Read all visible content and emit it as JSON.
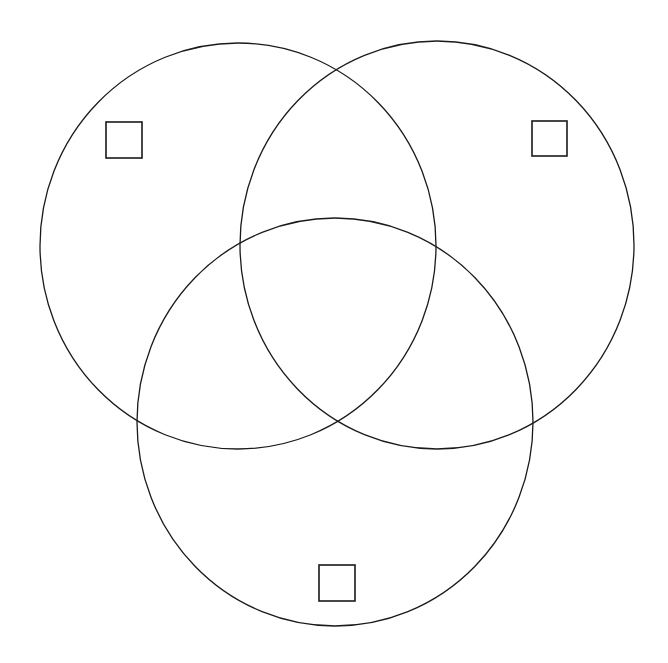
{
  "diagram": {
    "type": "venn",
    "set_count": 3,
    "background": "#ffffff",
    "stroke_color": "#1a1a1a",
    "sets": [
      {
        "id": "left",
        "cx": 238,
        "cy": 246,
        "rx": 198,
        "ry": 203
      },
      {
        "id": "right",
        "cx": 437,
        "cy": 245,
        "rx": 197,
        "ry": 204
      },
      {
        "id": "bottom",
        "cx": 335,
        "cy": 422,
        "rx": 198,
        "ry": 204
      }
    ],
    "checkboxes": [
      {
        "id": "left-set-checkbox",
        "x": 106,
        "y": 122,
        "size": 36,
        "checked": false
      },
      {
        "id": "right-set-checkbox",
        "x": 532,
        "y": 121,
        "size": 35,
        "checked": false
      },
      {
        "id": "bottom-set-checkbox",
        "x": 319,
        "y": 565,
        "size": 36,
        "checked": false
      }
    ]
  }
}
